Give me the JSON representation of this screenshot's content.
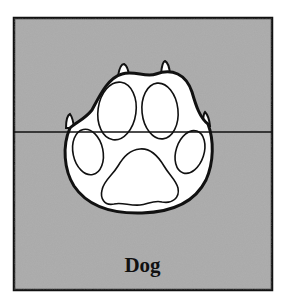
{
  "diagram": {
    "label": "Dog",
    "colors": {
      "background": "#ffffff",
      "panel_fill": "#a9a9a9",
      "outline": "#111111",
      "paw_fill": "#ffffff"
    },
    "panel": {
      "x": 14,
      "y": 18,
      "width": 258,
      "height": 272
    },
    "horizontal_line_y": 132
  }
}
